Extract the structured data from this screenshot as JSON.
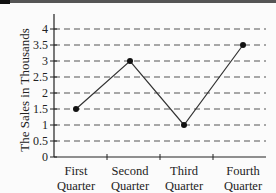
{
  "chart_data": {
    "type": "line",
    "title": "",
    "xlabel": "",
    "ylabel": "The Sales in Thousands",
    "categories": [
      "First Quarter",
      "Second Quarter",
      "Third Quarter",
      "Fourth Quarter"
    ],
    "category_lines": [
      [
        "First",
        "Quarter"
      ],
      [
        "Second",
        "Quarter"
      ],
      [
        "Third",
        "Quarter"
      ],
      [
        "Fourth",
        "Quarter"
      ]
    ],
    "series": [
      {
        "name": "Sales",
        "values": [
          1.5,
          3,
          1,
          3.5
        ]
      }
    ],
    "ylim": [
      0,
      4
    ],
    "yticks": [
      "0",
      "0.5",
      "1",
      "1.5",
      "2",
      "2.5",
      "3",
      "3.5",
      "4"
    ],
    "grid": "horizontal dashed",
    "legend": "none"
  },
  "colors": {
    "line": "#333333",
    "grid": "#555555",
    "axis": "#222222"
  }
}
